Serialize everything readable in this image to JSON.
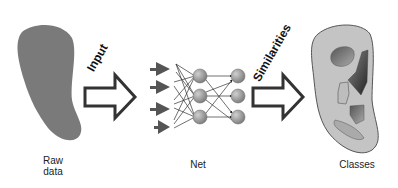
{
  "diagram": {
    "labels": {
      "raw_data": "Raw data",
      "raw_data_line1": "Raw",
      "raw_data_line2": "data",
      "net": "Net",
      "classes": "Classes",
      "input_arrow": "Input",
      "similarities_arrow": "Similarities"
    },
    "stages": [
      {
        "id": "raw-data",
        "label": "Raw data",
        "shape": "gray-blob"
      },
      {
        "id": "input",
        "label": "Input",
        "shape": "hollow-arrow"
      },
      {
        "id": "net",
        "label": "Net",
        "shape": "neural-network",
        "input_arrows": 4,
        "layers": [
          3,
          3
        ]
      },
      {
        "id": "similarities",
        "label": "Similarities",
        "shape": "hollow-arrow"
      },
      {
        "id": "classes",
        "label": "Classes",
        "shape": "blob-with-clusters",
        "clusters": 5
      }
    ],
    "colors": {
      "blob": "#7a7a7a",
      "classes_blob": "#c4c4c4",
      "node": "#9a9a9a",
      "arrow_stroke": "#333333"
    }
  }
}
